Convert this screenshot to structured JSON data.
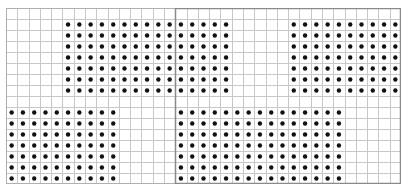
{
  "grid": {
    "columns": 35,
    "rows": 16,
    "line_color": "#c8c8c8",
    "dot_color": "#111111",
    "highlight_border_color": "#8a8a8a",
    "highlight_region": {
      "col_start": 15,
      "col_end": 35,
      "row_start": 0,
      "row_end": 16
    },
    "dot_blocks": [
      {
        "name": "top-left-block",
        "col_start": 5,
        "cols": 15,
        "row_start": 1,
        "rows": 7
      },
      {
        "name": "top-right-block",
        "col_start": 25,
        "cols": 10,
        "row_start": 1,
        "rows": 7
      },
      {
        "name": "bottom-left-block",
        "col_start": 0,
        "cols": 10,
        "row_start": 9,
        "rows": 7
      },
      {
        "name": "bottom-right-block",
        "col_start": 15,
        "cols": 15,
        "row_start": 9,
        "rows": 7
      }
    ]
  }
}
